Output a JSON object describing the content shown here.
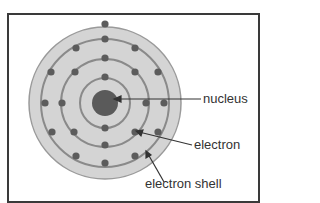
{
  "diagram": {
    "labels": {
      "nucleus": "nucleus",
      "electron": "electron",
      "electron_shell": "electron shell"
    },
    "colors": {
      "frame": "#3a3a3a",
      "disc": "#d4d4d4",
      "shell": "#8a8a8a",
      "electron": "#5c5c5c",
      "nucleus": "#5a5a5a",
      "text": "#333333"
    },
    "shell_count": 3,
    "electron_count": 22
  }
}
